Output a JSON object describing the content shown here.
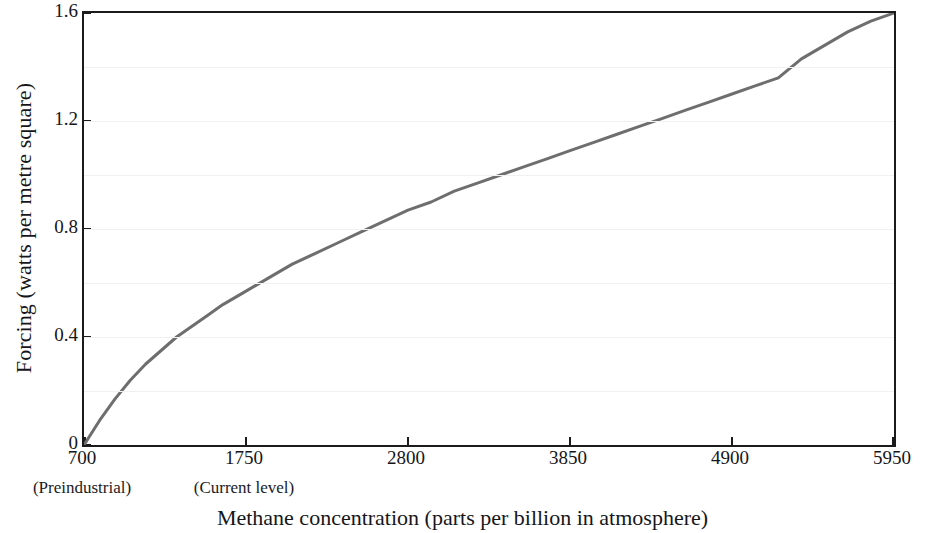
{
  "chart_data": {
    "type": "line",
    "title": "",
    "xlabel": "Methane concentration (parts per billion in atmosphere)",
    "ylabel": "Forcing (watts per metre square)",
    "xlim": [
      700,
      5950
    ],
    "ylim": [
      0,
      1.6
    ],
    "xticks": [
      700,
      1750,
      2800,
      3850,
      4900,
      5950
    ],
    "xtick_labels": [
      "700",
      "1750",
      "2800",
      "3850",
      "4900",
      "5950"
    ],
    "xtick_annotations": [
      {
        "x": 700,
        "label": "(Preindustrial)"
      },
      {
        "x": 1750,
        "label": "(Current level)"
      }
    ],
    "yticks": [
      0,
      0.4,
      0.8,
      1.2,
      1.6
    ],
    "ytick_labels": [
      "0",
      "0.4",
      "0.8",
      "1.2",
      "1.6"
    ],
    "grid": false,
    "legend": null,
    "series": [
      {
        "name": "Methane radiative forcing",
        "color": "#6e6e6e",
        "linewidth": 3,
        "x": [
          700,
          800,
          900,
          1000,
          1100,
          1200,
          1300,
          1400,
          1500,
          1600,
          1750,
          1900,
          2050,
          2200,
          2350,
          2500,
          2650,
          2800,
          2950,
          3100,
          3250,
          3400,
          3550,
          3700,
          3850,
          4000,
          4150,
          4300,
          4450,
          4600,
          4750,
          4900,
          5050,
          5200,
          5350,
          5500,
          5650,
          5800,
          5950
        ],
        "y": [
          0,
          0.09,
          0.17,
          0.24,
          0.3,
          0.35,
          0.4,
          0.44,
          0.48,
          0.52,
          0.57,
          0.62,
          0.67,
          0.71,
          0.75,
          0.79,
          0.83,
          0.87,
          0.9,
          0.94,
          0.97,
          1.0,
          1.03,
          1.06,
          1.09,
          1.12,
          1.15,
          1.18,
          1.21,
          1.24,
          1.27,
          1.3,
          1.33,
          1.36,
          1.43,
          1.48,
          1.53,
          1.57,
          1.6
        ]
      }
    ]
  },
  "axis": {
    "ylabel_text": "Forcing (watts per metre square)",
    "xlabel_text": "Methane concentration (parts per billion in atmosphere)"
  }
}
